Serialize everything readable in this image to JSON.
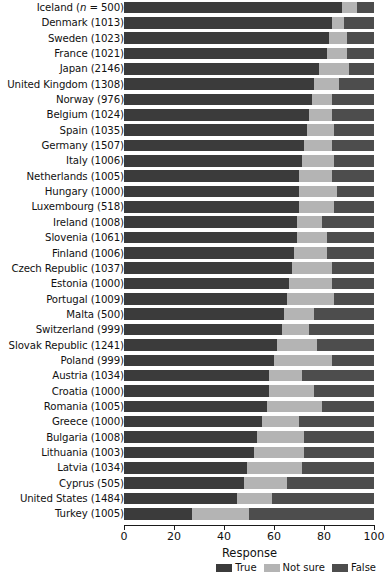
{
  "chart_data": {
    "type": "bar",
    "orientation": "horizontal",
    "stacked": true,
    "stacked_mode": "percent",
    "title": "",
    "xlabel": "Response",
    "ylabel": "",
    "xlim": [
      0,
      100
    ],
    "xticks": [
      0,
      20,
      40,
      60,
      80,
      100
    ],
    "grid": false,
    "legend_position": "bottom-right",
    "legend": [
      "True",
      "Not sure",
      "False"
    ],
    "colors": {
      "True": "#3b3b3b",
      "Not sure": "#b4b4b4",
      "False": "#4d4d4d",
      "background": "#ffffff",
      "axis": "#1a1a1a"
    },
    "categories": [
      "Iceland (n = 500)",
      "Denmark (1013)",
      "Sweden (1023)",
      "France (1021)",
      "Japan (2146)",
      "United Kingdom (1308)",
      "Norway (976)",
      "Belgium (1024)",
      "Spain (1035)",
      "Germany (1507)",
      "Italy (1006)",
      "Netherlands (1005)",
      "Hungary (1000)",
      "Luxembourg (518)",
      "Ireland (1008)",
      "Slovenia (1061)",
      "Finland (1006)",
      "Czech Republic (1037)",
      "Estonia (1000)",
      "Portugal (1009)",
      "Malta (500)",
      "Switzerland (999)",
      "Slovak Republic (1241)",
      "Poland (999)",
      "Austria (1034)",
      "Croatia (1000)",
      "Romania (1005)",
      "Greece (1000)",
      "Bulgaria (1008)",
      "Lithuania (1003)",
      "Latvia (1034)",
      "Cyprus (505)",
      "United States (1484)",
      "Turkey (1005)"
    ],
    "series": [
      {
        "name": "True",
        "values": [
          87,
          83,
          82,
          81,
          78,
          76,
          75,
          74,
          73,
          72,
          71,
          70,
          70,
          70,
          69,
          69,
          68,
          67,
          66,
          65,
          64,
          63,
          61,
          60,
          58,
          58,
          57,
          55,
          53,
          52,
          49,
          48,
          45,
          27
        ]
      },
      {
        "name": "Not sure",
        "values": [
          6,
          5,
          7,
          8,
          12,
          10,
          8,
          9,
          11,
          11,
          13,
          13,
          15,
          14,
          10,
          12,
          13,
          16,
          17,
          19,
          12,
          11,
          16,
          23,
          13,
          18,
          22,
          15,
          19,
          20,
          22,
          17,
          14,
          23
        ]
      },
      {
        "name": "False",
        "values": [
          7,
          12,
          11,
          11,
          10,
          14,
          17,
          17,
          16,
          17,
          16,
          17,
          15,
          16,
          21,
          19,
          19,
          17,
          17,
          16,
          24,
          26,
          23,
          17,
          29,
          24,
          21,
          30,
          28,
          28,
          29,
          35,
          41,
          50
        ]
      }
    ]
  }
}
